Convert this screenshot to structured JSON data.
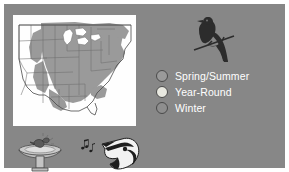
{
  "figure": {
    "kind": "bird-range-map-infographic",
    "background_color": "#878787",
    "outer_margin_color": "#ffffff"
  },
  "map": {
    "name": "united-states-range-map",
    "land_color": "#ffffff",
    "range_shade_color": "#9a9a9a",
    "outline_color": "#6e6e6e",
    "great_lakes_color": "#ffffff",
    "region_described": "eastern and central United States"
  },
  "legend": {
    "items": [
      {
        "label": "Spring/Summer",
        "color": "#9a9a9a",
        "border_color": "#4a4a4a"
      },
      {
        "label": "Year-Round",
        "color": "#e8e8e0",
        "border_color": "#4a4a4a"
      },
      {
        "label": "Winter",
        "color": "#8e8e8e",
        "border_color": "#4a4a4a"
      }
    ],
    "text_color": "#ffffff"
  },
  "icons": {
    "bird_silhouette": {
      "name": "perched-bird-silhouette",
      "color": "#2c2c2c",
      "branch_color": "#2c2c2c"
    },
    "birdbath": {
      "name": "birdbath-with-bathing-bird",
      "basin_color": "#c9c9c9",
      "pedestal_color": "#bdbdbd",
      "outline_color": "#4a4a4a"
    },
    "singing_bird": {
      "name": "singing-bird-head",
      "dark_color": "#1e1e1e",
      "light_color": "#f2f2f2",
      "note_color": "#1e1e1e",
      "notes_count": 3
    }
  }
}
